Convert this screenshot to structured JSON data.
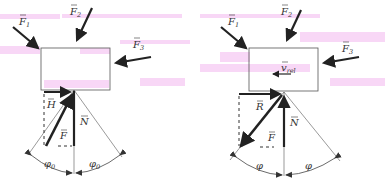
{
  "colors": {
    "ink": "#222222",
    "thin_line": "#555555",
    "watermark": "#f3b6ef",
    "background": "#ffffff"
  },
  "left_diagram": {
    "forces": [
      {
        "label": "F",
        "subscript": "1"
      },
      {
        "label": "F",
        "subscript": "2"
      },
      {
        "label": "F",
        "subscript": "3"
      }
    ],
    "reaction_labels": {
      "horizontal": "H",
      "resultant": "F",
      "normal": "N"
    },
    "angle_labels": [
      {
        "symbol": "φ",
        "subscript": "0"
      },
      {
        "symbol": "φ",
        "subscript": "0"
      }
    ]
  },
  "right_diagram": {
    "forces": [
      {
        "label": "F",
        "subscript": "1"
      },
      {
        "label": "F",
        "subscript": "2"
      },
      {
        "label": "F",
        "subscript": "3"
      }
    ],
    "velocity_label": {
      "symbol": "v",
      "subscript": "rel"
    },
    "reaction_labels": {
      "resultant": "R",
      "friction": "F",
      "normal": "N"
    },
    "angle_labels": [
      {
        "symbol": "φ",
        "subscript": ""
      },
      {
        "symbol": "φ",
        "subscript": ""
      }
    ]
  }
}
